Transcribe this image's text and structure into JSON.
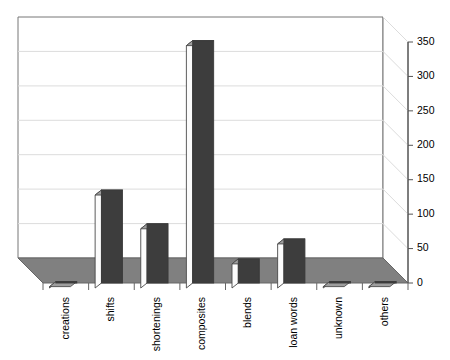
{
  "chart_data": {
    "type": "bar",
    "title": "",
    "subtitle": "",
    "xlabel": "",
    "ylabel": "",
    "categories": [
      "creations",
      "shifts",
      "shortenings",
      "composites",
      "blends",
      "loan words",
      "unknown",
      "others"
    ],
    "values": [
      2,
      135,
      86,
      352,
      35,
      64,
      2,
      2
    ],
    "ylim": [
      0,
      350
    ],
    "yticks": [
      0,
      50,
      100,
      150,
      200,
      250,
      300,
      350
    ],
    "ytick_labels": [
      "0",
      "50",
      "100",
      "150",
      "200",
      "250",
      "300",
      "350"
    ],
    "grid": true,
    "legend": false,
    "legend_position": "none",
    "style": "3d-column",
    "colors": {
      "bar_front": "#3d3d3d",
      "bar_left": "#fcfcfc",
      "bar_top": "#9e9e9e",
      "floor": "#808080",
      "wall": "#ffffff",
      "gridline": "#d9d9d9",
      "axis": "#666666",
      "text": "#000000"
    }
  },
  "axes": {
    "y_axis_title": "",
    "x_axis_title": ""
  }
}
